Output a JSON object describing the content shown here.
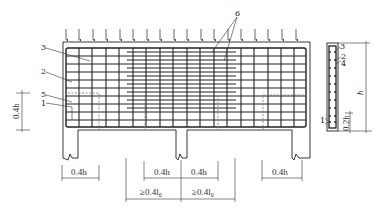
{
  "diagram": {
    "callouts": [
      {
        "id": "1",
        "label": "1"
      },
      {
        "id": "2",
        "label": "2"
      },
      {
        "id": "3",
        "label": "3"
      },
      {
        "id": "5",
        "label": "5"
      },
      {
        "id": "6",
        "label": "6"
      }
    ],
    "section_callouts": [
      "3",
      "2",
      "4",
      "1"
    ],
    "dimensions": {
      "left_height": "0.4h",
      "left_support": "0.4h",
      "center_left": "0.4h",
      "center_right": "0.4h",
      "right_support": "0.4h",
      "span_left": "≥0.4l",
      "span_right": "≥0.4l",
      "span_subscript": "0",
      "section_height": "h",
      "section_bottom": "0.2h"
    },
    "load_arrows_count": 18
  }
}
